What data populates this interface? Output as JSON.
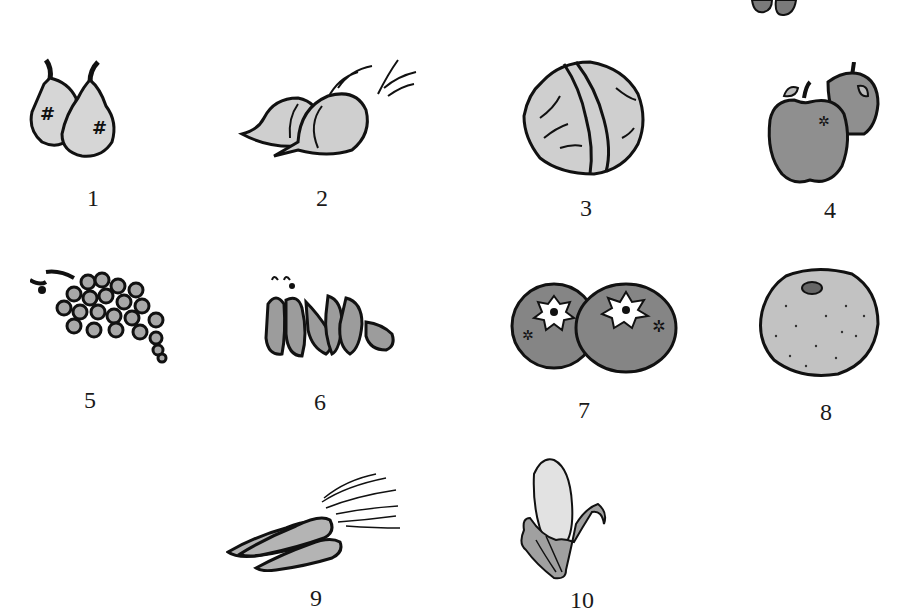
{
  "sheet": {
    "title": "Fruits and vegetables picture sheet",
    "colors": {
      "outline": "#111111",
      "fill_light": "#d4d4d4",
      "fill_mid": "#a8a8a8",
      "fill_dark": "#8a8a8a",
      "background": "#ffffff"
    }
  },
  "items": [
    {
      "number": "1",
      "name": "pears",
      "icon": "pear-icon"
    },
    {
      "number": "2",
      "name": "onions",
      "icon": "onion-icon"
    },
    {
      "number": "3",
      "name": "cabbage",
      "icon": "cabbage-icon"
    },
    {
      "number": "4",
      "name": "apples",
      "icon": "apple-icon"
    },
    {
      "number": "5",
      "name": "grapes",
      "icon": "grapes-icon"
    },
    {
      "number": "6",
      "name": "peas",
      "icon": "pea-pod-icon"
    },
    {
      "number": "7",
      "name": "oranges",
      "icon": "orange-icon"
    },
    {
      "number": "8",
      "name": "melon",
      "icon": "melon-icon"
    },
    {
      "number": "9",
      "name": "carrots",
      "icon": "carrot-icon"
    },
    {
      "number": "10",
      "name": "corn",
      "icon": "corn-icon"
    }
  ]
}
